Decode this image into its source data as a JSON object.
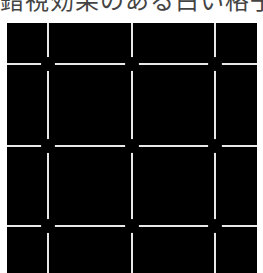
{
  "caption": {
    "text": "錯視効果のある白い格子図",
    "color": "#444444"
  },
  "figure": {
    "type": "illusion-grid",
    "background_color": "#000000",
    "line_color": "#e8e8e8",
    "dot_color": "#000000",
    "vertical_lines_x": [
      41,
      125,
      208
    ],
    "horizontal_lines_y": [
      41,
      123,
      203
    ]
  }
}
